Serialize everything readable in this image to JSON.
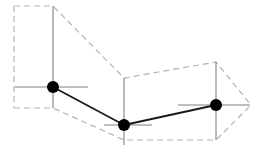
{
  "figure": {
    "canvas": {
      "width": 266,
      "height": 148,
      "background": "#ffffff"
    },
    "colors": {
      "envelope": "#b3b3b3",
      "crosshair": "#808080",
      "polyline": "#1a1a1a",
      "marker_fill": "#000000"
    },
    "strokes": {
      "envelope_width": 1.2,
      "envelope_dash": "6 4",
      "crosshair_width": 1.1,
      "polyline_width": 1.8,
      "marker_radius": 6
    },
    "vertices": [
      {
        "label": "vertex-left",
        "x": 53,
        "y": 87
      },
      {
        "label": "vertex-middle",
        "x": 124,
        "y": 125
      },
      {
        "label": "vertex-right",
        "x": 216,
        "y": 105
      }
    ],
    "polyline_points": "53,87 124,125 216,105",
    "crosshairs": [
      {
        "label": "crosshair-left",
        "x": 53,
        "y": 87,
        "x1": 15,
        "x2": 88,
        "y1": 6,
        "y2": 108
      },
      {
        "label": "crosshair-middle",
        "x": 124,
        "y": 125,
        "x1": 104,
        "x2": 152,
        "y1": 78,
        "y2": 145
      },
      {
        "label": "crosshair-right",
        "x": 216,
        "y": 105,
        "x1": 178,
        "x2": 250,
        "y1": 62,
        "y2": 140
      }
    ],
    "envelope_upper_points": "14,6 53,6 124,78 216,62 251,105",
    "envelope_lower_points": "14,108 53,108 124,140 216,140 251,105",
    "envelope_left_edge": {
      "x1": 14,
      "y1": 6,
      "x2": 14,
      "y2": 108
    }
  }
}
